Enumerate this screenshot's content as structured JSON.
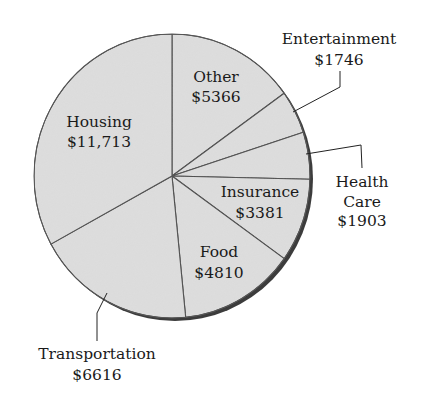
{
  "chart_data": {
    "type": "pie",
    "title": "",
    "total": 35535,
    "start_angle_deg": -90,
    "direction": "clockwise",
    "slices": [
      {
        "label": "Other",
        "value": 5366,
        "value_text": "$5366",
        "label_inside": true
      },
      {
        "label": "Entertainment",
        "value": 1746,
        "value_text": "$1746",
        "label_inside": false
      },
      {
        "label": "Health Care",
        "value": 1903,
        "value_text": "$1903",
        "label_inside": false
      },
      {
        "label": "Insurance",
        "value": 3381,
        "value_text": "$3381",
        "label_inside": true
      },
      {
        "label": "Food",
        "value": 4810,
        "value_text": "$4810",
        "label_inside": true
      },
      {
        "label": "Transportation",
        "value": 6616,
        "value_text": "$6616",
        "label_inside": false
      },
      {
        "label": "Housing",
        "value": 11713,
        "value_text": "$11,713",
        "label_inside": true
      }
    ],
    "legend": "none",
    "colors": {
      "fill": "#dedede",
      "edge": "#4a4a4a",
      "shadow": "#3c3c3c",
      "text": "#1a1a1a"
    }
  },
  "labels": {
    "other": {
      "name": "Other",
      "value": "$5366"
    },
    "entertainment": {
      "name": "Entertainment",
      "value": "$1746"
    },
    "health_care": {
      "line1": "Health",
      "line2": "Care",
      "value": "$1903"
    },
    "insurance": {
      "name": "Insurance",
      "value": "$3381"
    },
    "food": {
      "name": "Food",
      "value": "$4810"
    },
    "transportation": {
      "name": "Transportation",
      "value": "$6616"
    },
    "housing": {
      "name": "Housing",
      "value": "$11,713"
    }
  }
}
